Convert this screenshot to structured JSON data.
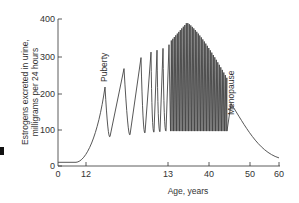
{
  "chart_data": {
    "type": "line",
    "title": "",
    "xlabel": "Age, years",
    "ylabel_line1": "Estrogens excreted in urine,",
    "ylabel_line2": "milligrams per 24 hours",
    "ylim": [
      0,
      400
    ],
    "y_ticks": [
      "0",
      "100",
      "200",
      "300",
      "400"
    ],
    "x_ticks": [
      "0",
      "12",
      "13",
      "40",
      "50",
      "60"
    ],
    "x_axis_note": "Non-linear (broken) age axis; ticks shown as printed",
    "grid": false,
    "legend": null,
    "annotations": [
      {
        "text": "Puberty",
        "near_value": 215
      },
      {
        "text": "Menopause",
        "near_value": 170
      }
    ],
    "series": [
      {
        "name": "Estrogen excretion",
        "description": "Baseline ~10 until age 12, rise at puberty with cyclic oscillations of increasing amplitude, dense monthly cycles peaking ~390, declining to menopause peak ~170, then decay to ~20 at age 60",
        "key_points": [
          {
            "phase": "childhood baseline",
            "value": 10
          },
          {
            "phase": "puberty peak 1",
            "value": 215
          },
          {
            "phase": "trough",
            "value": 80
          },
          {
            "phase": "peak 2",
            "value": 265
          },
          {
            "phase": "trough",
            "value": 85
          },
          {
            "phase": "peak 3",
            "value": 295
          },
          {
            "phase": "peak 4",
            "value": 310
          },
          {
            "phase": "peak 5",
            "value": 315
          },
          {
            "phase": "peak 6",
            "value": 320
          },
          {
            "phase": "reproductive cycles max",
            "value": 390
          },
          {
            "phase": "reproductive cycle troughs",
            "value": 95
          },
          {
            "phase": "pre-menopause cycles",
            "value": 250
          },
          {
            "phase": "menopause peak",
            "value": 170
          },
          {
            "phase": "age 60",
            "value": 20
          }
        ]
      }
    ]
  }
}
